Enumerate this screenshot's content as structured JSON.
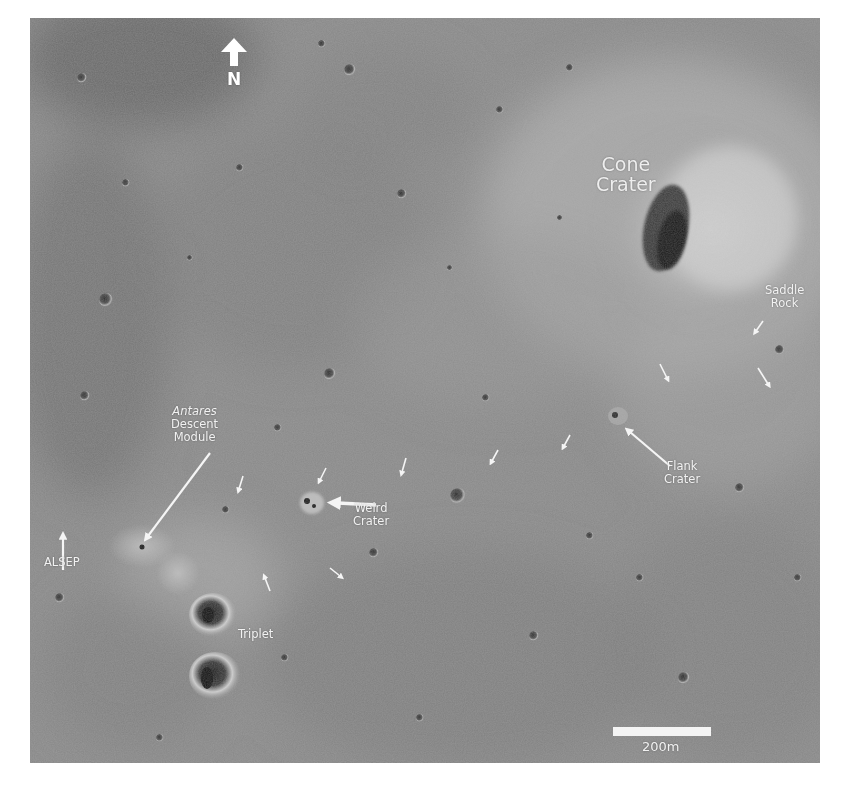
{
  "image": {
    "description": "Orbital image of the Apollo 14 landing site region near Cone Crater on the lunar surface",
    "background_color": "#ffffff",
    "surface_color": "#858585"
  },
  "north_indicator": {
    "label": "N",
    "icon": "arrow-up-icon"
  },
  "labels": {
    "cone_crater": [
      "Cone",
      "Crater"
    ],
    "saddle_rock": [
      "Saddle",
      "Rock"
    ],
    "antares": {
      "name": "Antares",
      "line2": "Descent",
      "line3": "Module"
    },
    "alsep": "ALSEP",
    "weird_crater": [
      "Weird",
      "Crater"
    ],
    "flank_crater": [
      "Flank",
      "Crater"
    ],
    "triplet": "Triplet"
  },
  "scale_bar": {
    "label": "200m",
    "color": "#f4f4f4"
  },
  "traverse_arrows": [
    {
      "x": 240,
      "y": 482
    },
    {
      "x": 322,
      "y": 472
    },
    {
      "x": 403,
      "y": 462
    },
    {
      "x": 498,
      "y": 453
    },
    {
      "x": 567,
      "y": 440
    },
    {
      "x": 663,
      "y": 372
    },
    {
      "x": 765,
      "y": 378
    },
    {
      "x": 335,
      "y": 572
    },
    {
      "x": 265,
      "y": 580
    }
  ]
}
